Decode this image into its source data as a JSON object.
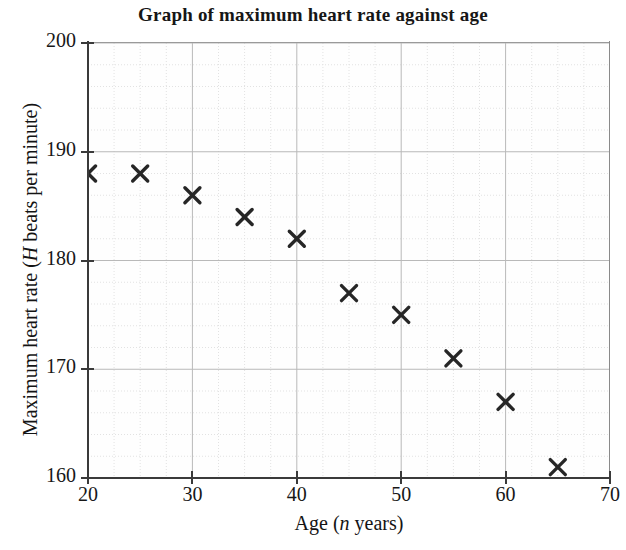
{
  "chart_data": {
    "type": "scatter",
    "title": "Graph of maximum heart rate against age",
    "xlabel": "Age (n years)",
    "ylabel": "Maximum heart rate (H beats per minute)",
    "xlabel_parts": {
      "prefix": "Age (",
      "italic": "n",
      "suffix": " years)"
    },
    "ylabel_parts": {
      "prefix": "Maximum heart rate (",
      "italic": "H",
      "suffix": " beats per minute)"
    },
    "xlim": [
      20,
      70
    ],
    "ylim": [
      160,
      200
    ],
    "x_major_ticks": [
      20,
      30,
      40,
      50,
      60,
      70
    ],
    "y_major_ticks": [
      160,
      170,
      180,
      190,
      200
    ],
    "x_minor_step": 2.5,
    "y_minor_step": 2,
    "grid": true,
    "legend": "none",
    "marker": "x-cross",
    "marker_color": "#262626",
    "x": [
      20,
      25,
      30,
      35,
      40,
      45,
      50,
      55,
      60,
      65
    ],
    "y": [
      188,
      188,
      186,
      184,
      182,
      177,
      175,
      171,
      167,
      161
    ],
    "points": [
      {
        "age": 20,
        "hr": 188
      },
      {
        "age": 25,
        "hr": 188
      },
      {
        "age": 30,
        "hr": 186
      },
      {
        "age": 35,
        "hr": 184
      },
      {
        "age": 40,
        "hr": 182
      },
      {
        "age": 45,
        "hr": 177
      },
      {
        "age": 50,
        "hr": 175
      },
      {
        "age": 55,
        "hr": 171
      },
      {
        "age": 60,
        "hr": 167
      },
      {
        "age": 65,
        "hr": 161
      }
    ]
  },
  "colors": {
    "axis": "#3a3a3a",
    "major_grid": "#b9b9b9",
    "minor_grid": "#e2e2e2",
    "marker": "#262626",
    "text": "#161616",
    "background": "#ffffff"
  }
}
